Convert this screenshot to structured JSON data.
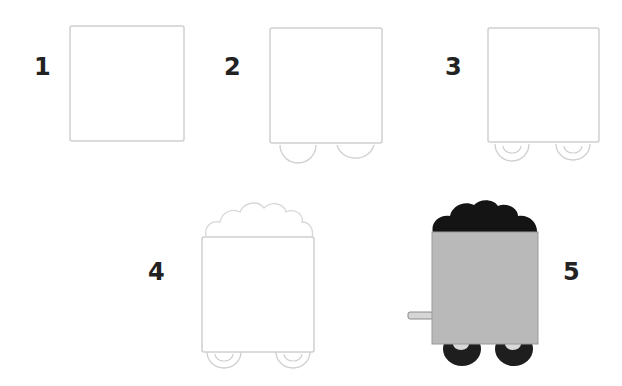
{
  "steps": [
    {
      "number": "1",
      "description": "Draw a square body"
    },
    {
      "number": "2",
      "description": "Add two half-circle wheels under the body"
    },
    {
      "number": "3",
      "description": "Add inner circles to the wheels"
    },
    {
      "number": "4",
      "description": "Draw a bumpy pile of coal on top"
    },
    {
      "number": "5",
      "description": "Color: grey body, black coal and wheels, add coupling rod"
    }
  ],
  "colors": {
    "sketch_line": "#cfcfcf",
    "body_fill": "#b9b9b9",
    "coal_fill": "#141414",
    "wheel_fill": "#1e1e1e",
    "number_color": "#222222"
  }
}
